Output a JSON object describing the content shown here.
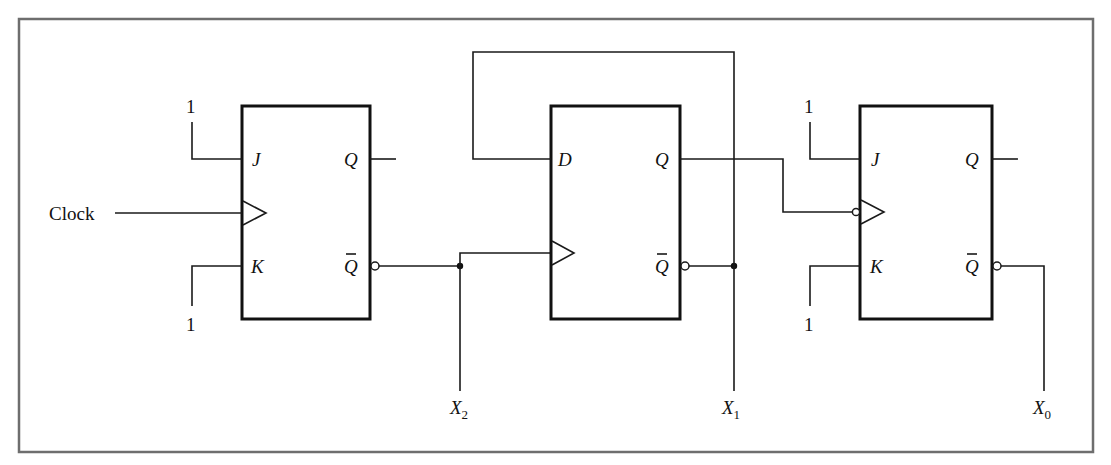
{
  "figure": {
    "type": "sequential logic circuit",
    "frame_color": "#6e6e6e",
    "line_color": "#1a1a1a"
  },
  "inputs": {
    "clock_label": "Clock",
    "ff1_j_const": "1",
    "ff1_k_const": "1",
    "ff3_j_const": "1",
    "ff3_k_const": "1"
  },
  "flip_flops": [
    {
      "id": "ff1",
      "kind": "JK",
      "pins": {
        "j": "J",
        "k": "K",
        "q": "Q",
        "qbar": "Q",
        "clock": "rising-edge"
      }
    },
    {
      "id": "ff2",
      "kind": "D",
      "pins": {
        "d": "D",
        "q": "Q",
        "qbar": "Q",
        "clock": "rising-edge"
      }
    },
    {
      "id": "ff3",
      "kind": "JK",
      "pins": {
        "j": "J",
        "k": "K",
        "q": "Q",
        "qbar": "Q",
        "clock": "falling-edge (inverted)"
      }
    }
  ],
  "outputs": [
    {
      "id": "x2",
      "base": "X",
      "sub": "2",
      "source": "ff1 Q̄"
    },
    {
      "id": "x1",
      "base": "X",
      "sub": "1",
      "source": "ff2 Q̄"
    },
    {
      "id": "x0",
      "base": "X",
      "sub": "0",
      "source": "ff3 Q̄"
    }
  ],
  "connections": [
    "Clock -> ff1 clock",
    "ff1 Q̄ -> ff2 clock, X2",
    "ff2 Q̄ -> ff2 D (feedback), X1",
    "ff2 Q -> ff3 clock (inverted)",
    "ff3 Q̄ -> X0"
  ]
}
